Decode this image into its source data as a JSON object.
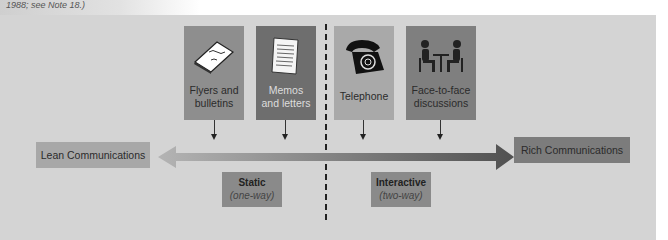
{
  "caption": "1988; see Note 18.)",
  "colors": {
    "panel": "#d4d4d4",
    "card_flyers": "#8e8e8e",
    "card_memos": "#6e6e6e",
    "card_telephone": "#a9a9a9",
    "card_face": "#7f7f7f",
    "lean_box": "#a8a8a8",
    "rich_box": "#7c7c7c",
    "arrow_left": "#b0b0b0",
    "arrow_right": "#5a5a5a",
    "static_tag": "#8a8a8a",
    "interactive_tag": "#8a8a8a"
  },
  "media": [
    {
      "label_line1": "Flyers and",
      "label_line2": "bulletins",
      "icon": "flyer-icon"
    },
    {
      "label_line1": "Memos",
      "label_line2": "and letters",
      "icon": "memo-icon"
    },
    {
      "label_line1": "Telephone",
      "label_line2": "",
      "icon": "telephone-icon"
    },
    {
      "label_line1": "Face-to-face",
      "label_line2": "discussions",
      "icon": "meeting-icon"
    }
  ],
  "axis": {
    "left_label": "Lean Communications",
    "right_label": "Rich Communications"
  },
  "categories": {
    "static": {
      "title": "Static",
      "subtitle": "(one-way)"
    },
    "interactive": {
      "title": "Interactive",
      "subtitle": "(two-way)"
    }
  }
}
